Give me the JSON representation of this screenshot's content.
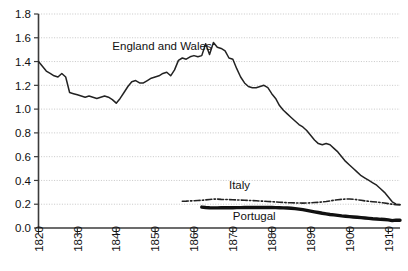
{
  "chart_data": {
    "type": "line",
    "title": "",
    "xlabel": "",
    "ylabel": "",
    "xlim": [
      1820,
      1913
    ],
    "ylim": [
      0.0,
      1.8
    ],
    "grid": true,
    "legend_position": "inline-annotations",
    "x_ticks": [
      "1820",
      "1830",
      "1840",
      "1850",
      "1860",
      "1870",
      "1880",
      "1890",
      "1900",
      "1910"
    ],
    "y_ticks": [
      "0.0",
      "0.2",
      "0.4",
      "0.6",
      "0.8",
      "1.0",
      "1.2",
      "1.4",
      "1.6",
      "1.8"
    ],
    "annotations": [
      {
        "text": "England and Wales",
        "x": 1839,
        "y": 1.5
      },
      {
        "text": "Italy",
        "x": 1869,
        "y": 0.33
      },
      {
        "text": "Portugal",
        "x": 1870,
        "y": 0.07
      }
    ],
    "series": [
      {
        "name": "England and Wales",
        "color": "#222222",
        "style": "solid",
        "width": 1.5,
        "x": [
          1820,
          1821,
          1822,
          1823,
          1824,
          1825,
          1826,
          1827,
          1828,
          1829,
          1830,
          1831,
          1832,
          1833,
          1834,
          1835,
          1836,
          1837,
          1838,
          1839,
          1840,
          1841,
          1842,
          1843,
          1844,
          1845,
          1846,
          1847,
          1848,
          1849,
          1850,
          1851,
          1852,
          1853,
          1854,
          1855,
          1856,
          1857,
          1858,
          1859,
          1860,
          1861,
          1862,
          1863,
          1864,
          1865,
          1866,
          1867,
          1868,
          1869,
          1870,
          1871,
          1872,
          1873,
          1874,
          1875,
          1876,
          1877,
          1878,
          1879,
          1880,
          1881,
          1882,
          1883,
          1884,
          1885,
          1886,
          1887,
          1888,
          1889,
          1890,
          1891,
          1892,
          1893,
          1894,
          1895,
          1896,
          1897,
          1898,
          1899,
          1900,
          1901,
          1902,
          1903,
          1904,
          1905,
          1906,
          1907,
          1908,
          1909,
          1910,
          1911,
          1912,
          1913
        ],
        "values": [
          1.4,
          1.36,
          1.32,
          1.3,
          1.28,
          1.27,
          1.3,
          1.27,
          1.14,
          1.13,
          1.12,
          1.11,
          1.1,
          1.11,
          1.1,
          1.09,
          1.1,
          1.11,
          1.1,
          1.08,
          1.05,
          1.09,
          1.14,
          1.19,
          1.23,
          1.24,
          1.22,
          1.22,
          1.24,
          1.26,
          1.27,
          1.28,
          1.3,
          1.31,
          1.28,
          1.33,
          1.41,
          1.43,
          1.42,
          1.44,
          1.45,
          1.44,
          1.45,
          1.55,
          1.46,
          1.56,
          1.52,
          1.51,
          1.49,
          1.43,
          1.42,
          1.34,
          1.27,
          1.22,
          1.19,
          1.18,
          1.18,
          1.19,
          1.2,
          1.18,
          1.13,
          1.09,
          1.03,
          0.99,
          0.96,
          0.93,
          0.9,
          0.87,
          0.85,
          0.82,
          0.78,
          0.74,
          0.71,
          0.7,
          0.71,
          0.7,
          0.67,
          0.64,
          0.6,
          0.56,
          0.53,
          0.5,
          0.47,
          0.44,
          0.42,
          0.4,
          0.38,
          0.36,
          0.33,
          0.3,
          0.26,
          0.22,
          0.2,
          0.195
        ]
      },
      {
        "name": "Italy",
        "color": "#222222",
        "style": "dash-dot",
        "width": 1.6,
        "x": [
          1857,
          1858,
          1859,
          1860,
          1861,
          1862,
          1863,
          1864,
          1865,
          1866,
          1867,
          1868,
          1869,
          1870,
          1871,
          1872,
          1873,
          1874,
          1875,
          1876,
          1877,
          1878,
          1879,
          1880,
          1881,
          1882,
          1883,
          1884,
          1885,
          1886,
          1887,
          1888,
          1889,
          1890,
          1891,
          1892,
          1893,
          1894,
          1895,
          1896,
          1897,
          1898,
          1899,
          1900,
          1901,
          1902,
          1903,
          1904,
          1905,
          1906,
          1907,
          1908,
          1909,
          1910,
          1911,
          1912,
          1913
        ],
        "values": [
          0.225,
          0.226,
          0.228,
          0.229,
          0.231,
          0.233,
          0.236,
          0.24,
          0.243,
          0.243,
          0.241,
          0.24,
          0.239,
          0.238,
          0.236,
          0.235,
          0.234,
          0.232,
          0.231,
          0.229,
          0.227,
          0.225,
          0.223,
          0.221,
          0.219,
          0.217,
          0.215,
          0.213,
          0.212,
          0.211,
          0.21,
          0.209,
          0.21,
          0.212,
          0.214,
          0.216,
          0.219,
          0.223,
          0.228,
          0.233,
          0.238,
          0.241,
          0.243,
          0.244,
          0.242,
          0.238,
          0.233,
          0.228,
          0.224,
          0.221,
          0.218,
          0.214,
          0.21,
          0.205,
          0.2,
          0.196,
          0.197
        ]
      },
      {
        "name": "Portugal",
        "color": "#111111",
        "style": "solid",
        "width": 3.4,
        "x": [
          1862,
          1863,
          1864,
          1865,
          1866,
          1867,
          1868,
          1869,
          1870,
          1871,
          1872,
          1873,
          1874,
          1875,
          1876,
          1877,
          1878,
          1879,
          1880,
          1881,
          1882,
          1883,
          1884,
          1885,
          1886,
          1887,
          1888,
          1889,
          1890,
          1891,
          1892,
          1893,
          1894,
          1895,
          1896,
          1897,
          1898,
          1899,
          1900,
          1901,
          1902,
          1903,
          1904,
          1905,
          1906,
          1907,
          1908,
          1909,
          1910,
          1911,
          1912,
          1913
        ],
        "values": [
          0.176,
          0.172,
          0.17,
          0.169,
          0.169,
          0.17,
          0.17,
          0.17,
          0.17,
          0.171,
          0.171,
          0.172,
          0.172,
          0.172,
          0.173,
          0.173,
          0.173,
          0.172,
          0.172,
          0.171,
          0.17,
          0.169,
          0.168,
          0.166,
          0.163,
          0.159,
          0.154,
          0.148,
          0.142,
          0.136,
          0.13,
          0.124,
          0.119,
          0.114,
          0.11,
          0.106,
          0.102,
          0.099,
          0.096,
          0.093,
          0.09,
          0.087,
          0.084,
          0.081,
          0.078,
          0.076,
          0.073,
          0.071,
          0.068,
          0.062,
          0.066,
          0.065
        ]
      }
    ]
  }
}
